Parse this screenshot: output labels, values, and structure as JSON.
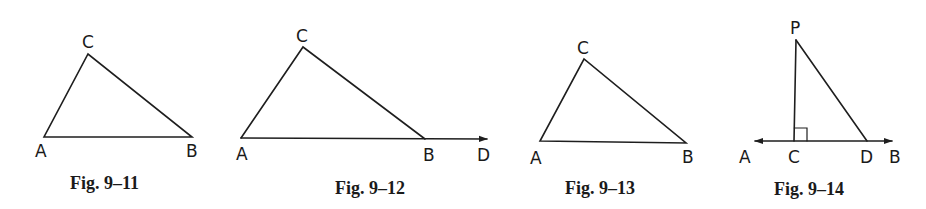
{
  "figures": [
    {
      "caption": "Fig. 9–11",
      "type": "triangle",
      "points": {
        "A": [
          44,
          137
        ],
        "B": [
          192,
          137
        ],
        "C": [
          88,
          54
        ]
      },
      "labels": {
        "A": "A",
        "B": "B",
        "C": "C"
      }
    },
    {
      "caption": "Fig. 9–12",
      "type": "triangle-with-exterior-ray",
      "points": {
        "A": [
          241,
          138
        ],
        "B": [
          425,
          139
        ],
        "C": [
          303,
          47
        ],
        "D": [
          487,
          139
        ]
      },
      "labels": {
        "A": "A",
        "B": "B",
        "C": "C",
        "D": "D"
      }
    },
    {
      "caption": "Fig. 9–13",
      "type": "triangle",
      "points": {
        "A": [
          540,
          141
        ],
        "B": [
          686,
          143
        ],
        "C": [
          584,
          59
        ]
      },
      "labels": {
        "A": "A",
        "B": "B",
        "C": "C"
      }
    },
    {
      "caption": "Fig. 9–14",
      "type": "perpendicular-to-line",
      "points": {
        "P": [
          796,
          40
        ],
        "C": [
          794,
          141
        ],
        "D": [
          867,
          141
        ],
        "A": [
          754,
          141
        ],
        "B": [
          892,
          141
        ]
      },
      "labels": {
        "P": "P",
        "A": "A",
        "C": "C",
        "D": "D",
        "B": "B"
      },
      "right_angle_at": "C"
    }
  ]
}
